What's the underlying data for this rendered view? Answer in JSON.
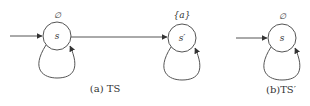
{
  "diagrams": [
    {
      "id": "a",
      "caption": "(a) TS",
      "states": [
        {
          "name": "s",
          "label": "∅",
          "initial": true,
          "self_loop": true
        },
        {
          "name": "s′",
          "label": "{a}",
          "initial": false,
          "self_loop": true
        }
      ],
      "transitions": [
        {
          "from": "s",
          "to": "s′"
        }
      ]
    },
    {
      "id": "b",
      "caption": "(b)TS′",
      "states": [
        {
          "name": "s",
          "label": "∅",
          "initial": true,
          "self_loop": true
        }
      ],
      "transitions": []
    }
  ],
  "colors": {
    "stroke": "#555555",
    "text": "#333333"
  }
}
